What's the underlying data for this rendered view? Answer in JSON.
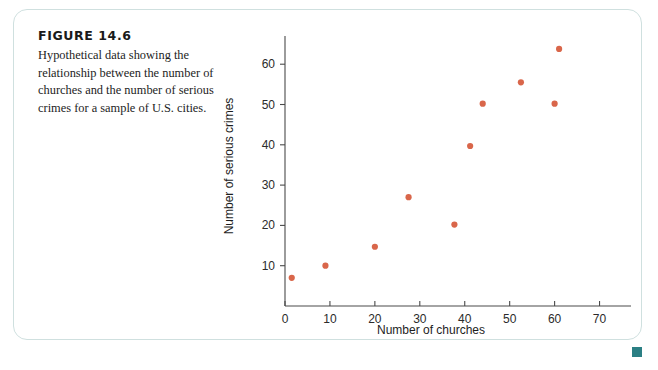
{
  "figure": {
    "number_label": "FIGURE 14.6",
    "caption": "Hypothetical data showing the relationship between the number of churches and the number of serious crimes for a sample of U.S. cities."
  },
  "colors": {
    "point": "#d9664a",
    "card_border": "#cfe0df",
    "axis": "#4a4a4a",
    "corner_marker": "#2b7f84",
    "text": "#1d1d1d"
  },
  "chart_data": {
    "type": "scatter",
    "title": "",
    "xlabel": "Number of churches",
    "ylabel": "Number of serious crimes",
    "xlim": [
      0,
      77
    ],
    "ylim": [
      0,
      67
    ],
    "xticks": [
      0,
      10,
      20,
      30,
      40,
      50,
      60,
      70
    ],
    "xtick_labels": [
      "0",
      "10",
      "20",
      "30",
      "40",
      "50",
      "60",
      "70"
    ],
    "yticks": [
      10,
      20,
      30,
      40,
      50,
      60
    ],
    "ytick_labels": [
      "10",
      "20",
      "30",
      "40",
      "50",
      "60"
    ],
    "grid": false,
    "legend": false,
    "series": [
      {
        "name": "U.S. cities",
        "marker": "circle",
        "color": "#d9664a",
        "points": [
          {
            "x": 1.5,
            "y": 7
          },
          {
            "x": 9,
            "y": 10
          },
          {
            "x": 20,
            "y": 14.7
          },
          {
            "x": 27.5,
            "y": 27
          },
          {
            "x": 37.7,
            "y": 20.2
          },
          {
            "x": 41.2,
            "y": 39.7
          },
          {
            "x": 44,
            "y": 50.2
          },
          {
            "x": 52.5,
            "y": 55.5
          },
          {
            "x": 60,
            "y": 50.2
          },
          {
            "x": 61,
            "y": 63.8
          }
        ]
      }
    ]
  }
}
